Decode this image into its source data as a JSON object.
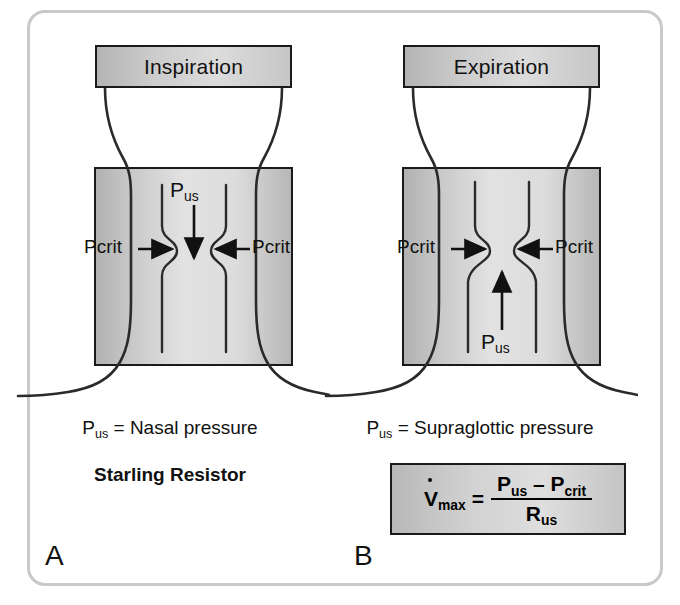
{
  "figure": {
    "type": "starling-resistor-diagram",
    "border_color": "#c9c9c9",
    "background": "#ffffff"
  },
  "panels": [
    {
      "letter": "A",
      "header_label": "Inspiration",
      "chamber_pressure_label_left": "Pcrit",
      "chamber_pressure_label_right": "Pcrit",
      "flow_pressure_symbol": "P",
      "flow_pressure_subscript": "us",
      "flow_direction": "down",
      "caption_prefix": "P",
      "caption_subscript": "us",
      "caption_text": " = Nasal pressure",
      "bold_caption": "Starling Resistor"
    },
    {
      "letter": "B",
      "header_label": "Expiration",
      "chamber_pressure_label_left": "Pcrit",
      "chamber_pressure_label_right": "Pcrit",
      "flow_pressure_symbol": "P",
      "flow_pressure_subscript": "us",
      "flow_direction": "up",
      "caption_prefix": "P",
      "caption_subscript": "us",
      "caption_text": " = Supraglottic pressure"
    }
  ],
  "formula": {
    "lhs_symbol": "V",
    "lhs_subscript": "max",
    "equals": "=",
    "numerator_term1": "P",
    "numerator_sub1": "us",
    "numerator_operator": "–",
    "numerator_term2": "P",
    "numerator_sub2": "crit",
    "denominator_term": "R",
    "denominator_sub": "us"
  }
}
